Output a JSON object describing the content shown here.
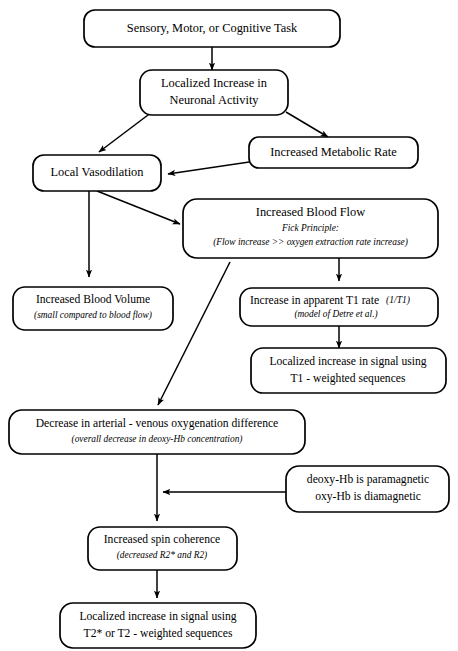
{
  "diagram": {
    "background_color": "#ffffff",
    "line_color": "#000000",
    "nodes": [
      {
        "id": "task",
        "lines": [
          "Sensory, Motor, or Cognitive Task"
        ]
      },
      {
        "id": "neuronal",
        "lines": [
          "Localized Increase in",
          "Neuronal Activity"
        ]
      },
      {
        "id": "metabolic",
        "lines": [
          "Increased Metabolic Rate"
        ]
      },
      {
        "id": "vasodilation",
        "lines": [
          "Local Vasodilation"
        ]
      },
      {
        "id": "bloodflow",
        "lines": [
          "Increased Blood Flow"
        ],
        "sub_lines": [
          "Fick Principle:",
          "(Flow increase >> oxygen extraction rate increase)"
        ]
      },
      {
        "id": "bloodvolume",
        "lines": [
          "Increased Blood Volume"
        ],
        "sub_lines": [
          "(small compared to blood flow)"
        ]
      },
      {
        "id": "t1rate",
        "lines": [
          "Increase in apparent T1 rate"
        ],
        "inline_italic": "(1/T1)",
        "sub_lines": [
          "(model of Detre et al.)"
        ]
      },
      {
        "id": "t1signal",
        "lines": [
          "Localized increase in signal using",
          "T1 - weighted sequences"
        ]
      },
      {
        "id": "oxydiff",
        "lines": [
          "Decrease in arterial - venous oxygenation difference"
        ],
        "sub_lines": [
          "(overall decrease in deoxy-Hb concentration)"
        ]
      },
      {
        "id": "magnetic",
        "lines": [
          "deoxy-Hb is paramagnetic",
          "oxy-Hb is diamagnetic"
        ]
      },
      {
        "id": "spincoherence",
        "lines": [
          "Increased spin coherence"
        ],
        "sub_lines": [
          "(decreased R2* and R2)"
        ]
      },
      {
        "id": "t2signal",
        "lines": [
          "Localized increase in signal using",
          "T2* or T2 - weighted sequences"
        ]
      }
    ],
    "edges": [
      {
        "from": "task",
        "to": "neuronal"
      },
      {
        "from": "neuronal",
        "to": "vasodilation"
      },
      {
        "from": "neuronal",
        "to": "metabolic"
      },
      {
        "from": "metabolic",
        "to": "vasodilation"
      },
      {
        "from": "vasodilation",
        "to": "bloodvolume"
      },
      {
        "from": "vasodilation",
        "to": "bloodflow"
      },
      {
        "from": "bloodflow",
        "to": "t1rate"
      },
      {
        "from": "bloodflow",
        "to": "oxydiff"
      },
      {
        "from": "t1rate",
        "to": "t1signal"
      },
      {
        "from": "oxydiff",
        "to": "spincoherence"
      },
      {
        "from": "magnetic",
        "to": "spincoherence"
      },
      {
        "from": "spincoherence",
        "to": "t2signal"
      }
    ]
  }
}
